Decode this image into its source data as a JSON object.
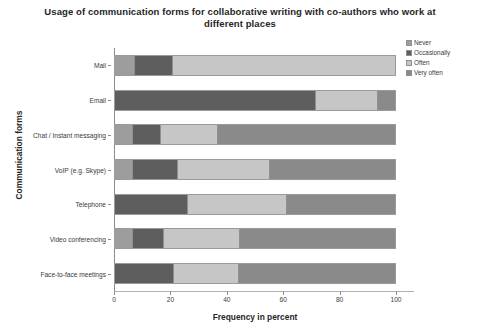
{
  "chart_data": {
    "type": "bar",
    "orientation": "horizontal",
    "stacked": true,
    "title": "Usage of communication forms for collaborative writing with co-authors who work at different places",
    "xlabel": "Frequency in percent",
    "ylabel": "Communication forms",
    "xlim": [
      0,
      100
    ],
    "xticks": [
      0,
      20,
      40,
      60,
      80,
      100
    ],
    "xtick_labels": [
      "0",
      "20",
      "40",
      "60",
      "80",
      "100"
    ],
    "grid": false,
    "legend_position": "right",
    "categories": [
      "Mail",
      "Email",
      "Chat / Instant messaging",
      "VoIP (e.g. Skype)",
      "Telephone",
      "Video conferencing",
      "Face-to-face meetings"
    ],
    "series": [
      {
        "name": "Never",
        "color": "#9d9d9d",
        "values": [
          7,
          0,
          6,
          6,
          0,
          6,
          0
        ]
      },
      {
        "name": "Occasionally",
        "color": "#5e5e5e",
        "values": [
          13,
          72,
          10,
          16,
          26,
          11,
          21
        ]
      },
      {
        "name": "Often",
        "color": "#c6c6c6",
        "values": [
          80,
          22,
          20,
          33,
          35,
          27,
          23
        ]
      },
      {
        "name": "Very often",
        "color": "#8a8a8a",
        "values": [
          0,
          6,
          64,
          45,
          39,
          56,
          56
        ]
      }
    ]
  },
  "legend": {
    "items": [
      {
        "label": "Never",
        "color": "#9d9d9d"
      },
      {
        "label": "Occasionally",
        "color": "#5e5e5e"
      },
      {
        "label": "Often",
        "color": "#c6c6c6"
      },
      {
        "label": "Very often",
        "color": "#8a8a8a"
      }
    ]
  }
}
